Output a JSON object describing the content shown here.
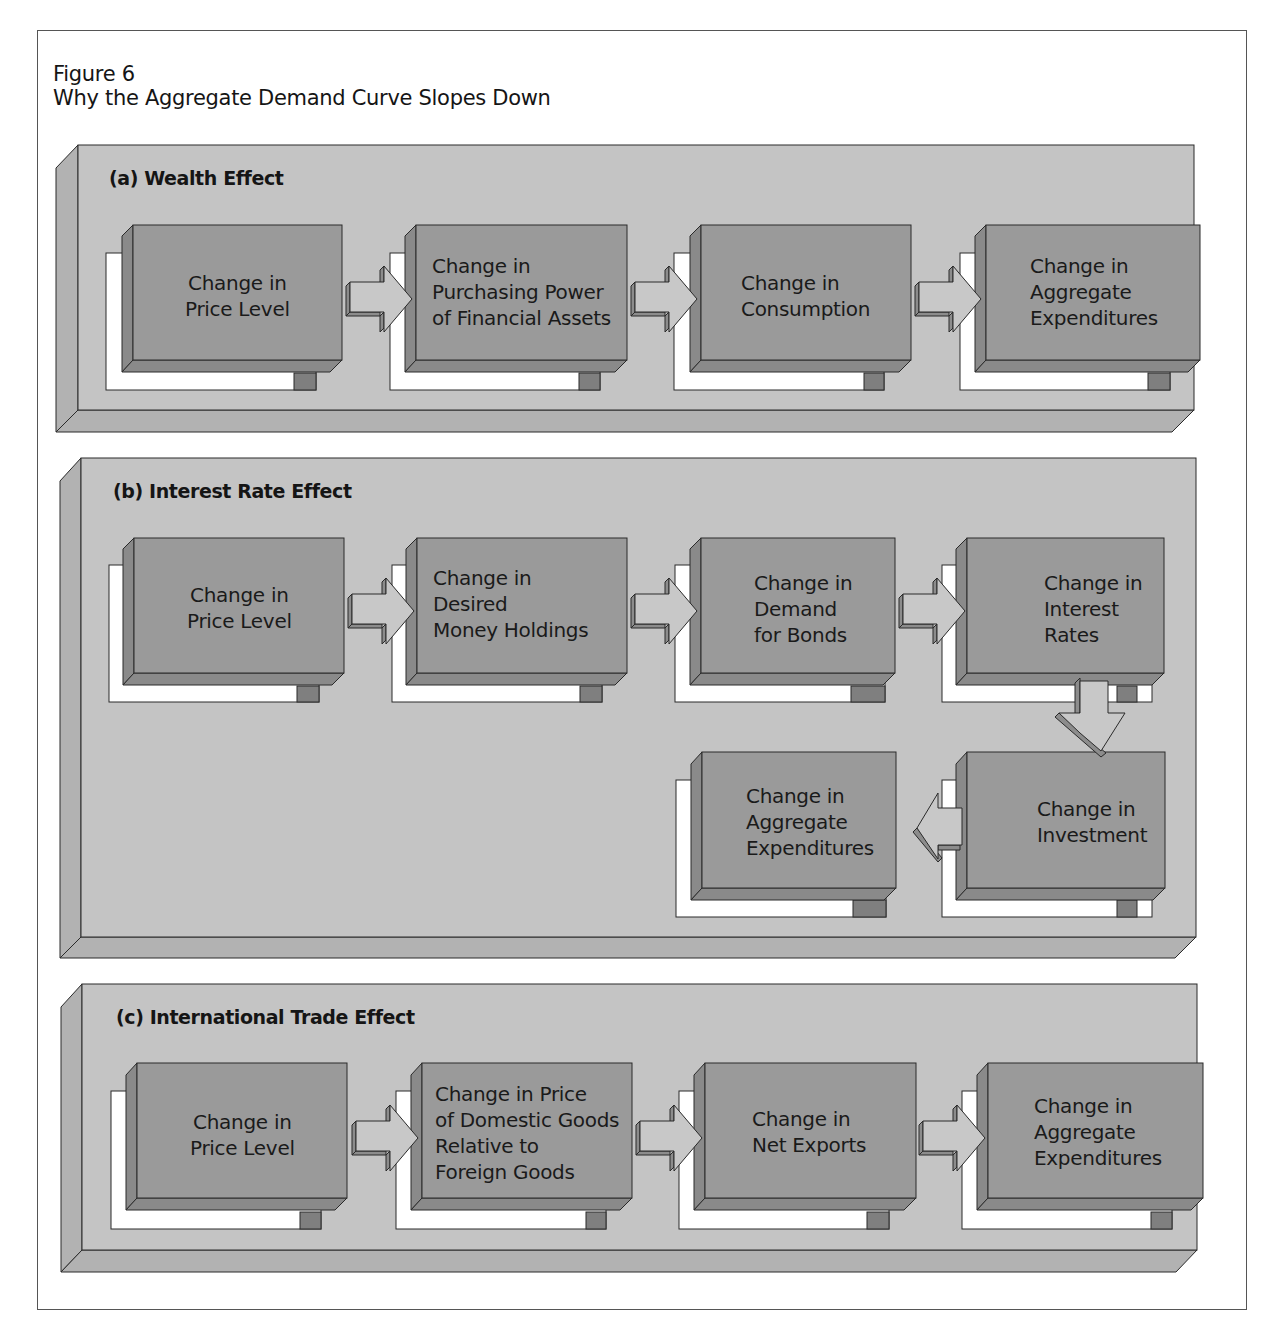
{
  "figure": {
    "number": "Figure 6",
    "title": "Why the Aggregate Demand Curve Slopes Down"
  },
  "colors": {
    "panel_face": "#c4c4c4",
    "panel_bevel": "#b2b2b2",
    "box_face": "#9a9a9a",
    "box_bevel": "#8a8a8a",
    "box_tab": "#7f7f7f",
    "arrow_face": "#c8c8c8",
    "arrow_side": "#8c8c8c",
    "shadow_frame": "#ffffff",
    "outline": "#2a2a2a"
  },
  "panels": [
    {
      "id": "a",
      "title": "(a) Wealth Effect",
      "boxes": [
        {
          "label": "Change in\nPrice Level"
        },
        {
          "label": "Change in\nPurchasing Power\nof Financial Assets"
        },
        {
          "label": "Change in\nConsumption"
        },
        {
          "label": "Change in\nAggregate\nExpenditures"
        }
      ],
      "arrows": [
        "right",
        "right",
        "right"
      ]
    },
    {
      "id": "b",
      "title": "(b) Interest Rate Effect",
      "boxes": [
        {
          "label": "Change in\nPrice Level"
        },
        {
          "label": "Change in\nDesired\nMoney Holdings"
        },
        {
          "label": "Change in\nDemand\nfor Bonds"
        },
        {
          "label": "Change in\nInterest\nRates"
        },
        {
          "label": "Change in\nInvestment"
        },
        {
          "label": "Change in\nAggregate\nExpenditures"
        }
      ],
      "arrows": [
        "right",
        "right",
        "right",
        "down",
        "left"
      ]
    },
    {
      "id": "c",
      "title": "(c) International Trade Effect",
      "boxes": [
        {
          "label": "Change in\nPrice Level"
        },
        {
          "label": "Change in Price\nof Domestic Goods\nRelative to\nForeign Goods"
        },
        {
          "label": "Change in\nNet Exports"
        },
        {
          "label": "Change in\nAggregate\nExpenditures"
        }
      ],
      "arrows": [
        "right",
        "right",
        "right"
      ]
    }
  ]
}
